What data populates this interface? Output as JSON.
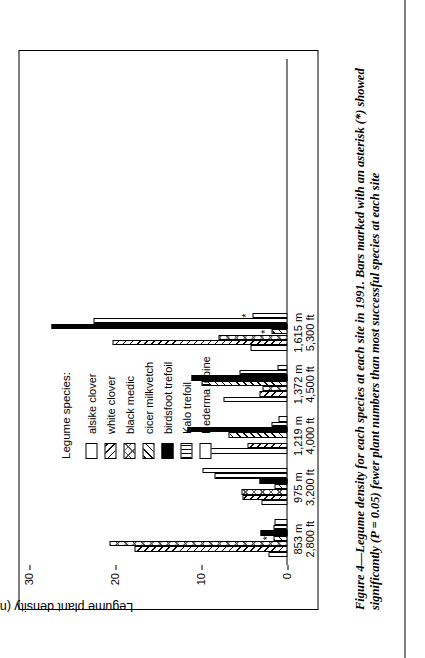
{
  "figure": {
    "caption": "Figure 4—Legume density for each species at each site in 1991. Bars marked with an asterisk (*) showed significantly (P = 0.05) fewer plant numbers than most successful species at each site",
    "asterisk_symbol": "*"
  },
  "legend": {
    "title": "Legume species:",
    "items": [
      {
        "label": "alsike clover",
        "pattern": "open"
      },
      {
        "label": "white clover",
        "pattern": "diagonal-right"
      },
      {
        "label": "black medic",
        "pattern": "crosshatch"
      },
      {
        "label": "cicer milkvetch",
        "pattern": "diagonal-left"
      },
      {
        "label": "birdsfoot trefoil",
        "pattern": "solid-black"
      },
      {
        "label": "Kalo trefoil",
        "pattern": "vertical-lines"
      },
      {
        "label": "Hederma lupine",
        "pattern": "dots"
      }
    ]
  },
  "chart_data": {
    "type": "bar",
    "title": "",
    "xlabel": "",
    "ylabel": "Legume plant density (number/m2)",
    "ylabel_display": "Legume plant density (number/m",
    "ylabel_superscript": "2",
    "ylabel_suffix": ")",
    "ylim": [
      0,
      30
    ],
    "yticks": [
      0,
      10,
      20,
      30
    ],
    "ytick_labels": [
      "0",
      "10",
      "20",
      "30"
    ],
    "grid": false,
    "legend_position": "upper-left",
    "categories": [
      "853 m\n2,800 ft",
      "975 m\n3,200 ft",
      "1,219 m\n4,000 ft",
      "1,372 m\n4,500 ft",
      "1,615 m\n5,300 ft"
    ],
    "category_labels": [
      {
        "meters": "853 m",
        "feet": "2,800 ft"
      },
      {
        "meters": "975 m",
        "feet": "3,200 ft"
      },
      {
        "meters": "1,219 m",
        "feet": "4,000 ft"
      },
      {
        "meters": "1,372 m",
        "feet": "4,500 ft"
      },
      {
        "meters": "1,615 m",
        "feet": "5,300 ft"
      }
    ],
    "series": [
      {
        "name": "alsike clover",
        "pattern": "open",
        "values": [
          2.2,
          3.0,
          9.3,
          7.5,
          4.3
        ],
        "asterisks": [
          false,
          false,
          false,
          false,
          false
        ]
      },
      {
        "name": "white clover",
        "pattern": "diagonal-right",
        "values": [
          17.8,
          5.2,
          4.6,
          3.2,
          20.4
        ],
        "asterisks": [
          false,
          false,
          false,
          false,
          false
        ]
      },
      {
        "name": "black medic",
        "pattern": "crosshatch",
        "values": [
          20.7,
          5.3,
          0.0,
          2.9,
          8.0
        ],
        "asterisks": [
          false,
          false,
          false,
          false,
          false
        ]
      },
      {
        "name": "cicer milkvetch",
        "pattern": "diagonal-left",
        "values": [
          1.6,
          1.5,
          6.9,
          10.0,
          1.9
        ],
        "asterisks": [
          true,
          false,
          false,
          false,
          true
        ]
      },
      {
        "name": "birdsfoot trefoil",
        "pattern": "solid-black",
        "values": [
          3.1,
          3.3,
          11.6,
          11.2,
          27.4
        ],
        "asterisks": [
          false,
          false,
          false,
          false,
          false
        ]
      },
      {
        "name": "Kalo trefoil",
        "pattern": "vertical-lines",
        "values": [
          1.6,
          8.5,
          1.9,
          5.6,
          22.6
        ],
        "asterisks": [
          false,
          false,
          false,
          false,
          false
        ]
      },
      {
        "name": "Hederma lupine",
        "pattern": "dots",
        "values": [
          1.5,
          9.9,
          1.0,
          1.2,
          4.1
        ],
        "asterisks": [
          false,
          false,
          false,
          false,
          true
        ]
      }
    ]
  }
}
